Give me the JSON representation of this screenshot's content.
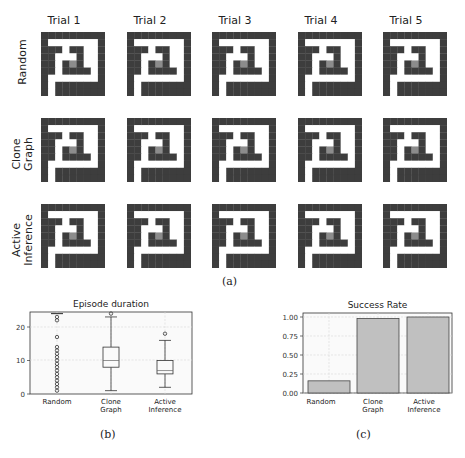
{
  "figure": {
    "panel_a": {
      "caption": "(a)",
      "column_titles": [
        "Trial 1",
        "Trial 2",
        "Trial 3",
        "Trial 4",
        "Trial 5"
      ],
      "row_labels": [
        "Random",
        "Clone\nGraph",
        "Active\nInference"
      ],
      "maze": {
        "size": 9,
        "wall_color": "#3d3d3d",
        "open_color": "#ffffff",
        "goal_color": "#8c8c8c",
        "cells": [
          [
            1,
            1,
            1,
            1,
            1,
            1,
            1,
            1,
            1
          ],
          [
            1,
            0,
            0,
            0,
            0,
            0,
            0,
            0,
            1
          ],
          [
            1,
            1,
            1,
            0,
            1,
            1,
            0,
            0,
            1
          ],
          [
            1,
            1,
            0,
            0,
            0,
            1,
            0,
            0,
            1
          ],
          [
            1,
            1,
            0,
            1,
            2,
            1,
            0,
            0,
            1
          ],
          [
            1,
            1,
            0,
            1,
            1,
            1,
            1,
            0,
            1
          ],
          [
            1,
            0,
            0,
            0,
            0,
            0,
            0,
            0,
            1
          ],
          [
            1,
            0,
            1,
            1,
            1,
            1,
            1,
            1,
            1
          ],
          [
            1,
            0,
            1,
            1,
            1,
            1,
            1,
            1,
            1
          ]
        ]
      }
    },
    "panel_b": {
      "caption": "(b)"
    },
    "panel_c": {
      "caption": "(c)"
    }
  },
  "chart_data": [
    {
      "type": "box",
      "title": "Episode duration",
      "xlabel": "",
      "ylabel": "",
      "categories": [
        "Random",
        "Clone\nGraph",
        "Active\nInference"
      ],
      "yticks": [
        0,
        10,
        20
      ],
      "ylim": [
        0,
        25
      ],
      "grid": true,
      "boxes": [
        {
          "name": "Random",
          "whisker_low": 24,
          "q1": 24,
          "median": 24,
          "q3": 24,
          "whisker_high": 24,
          "outliers": [
            23,
            22,
            17,
            14,
            13,
            12,
            11,
            10,
            9,
            8,
            7,
            6,
            5,
            4,
            3,
            2,
            1
          ]
        },
        {
          "name": "Clone Graph",
          "whisker_low": 1,
          "q1": 8,
          "median": 10,
          "q3": 14,
          "whisker_high": 23,
          "outliers": [
            24
          ]
        },
        {
          "name": "Active Inference",
          "whisker_low": 2,
          "q1": 6,
          "median": 7,
          "q3": 10,
          "whisker_high": 16,
          "outliers": [
            18
          ]
        }
      ]
    },
    {
      "type": "bar",
      "title": "Success Rate",
      "xlabel": "",
      "ylabel": "",
      "categories": [
        "Random",
        "Clone\nGraph",
        "Active\nInference"
      ],
      "values": [
        0.16,
        0.98,
        1.0
      ],
      "yticks": [
        "0.00",
        "0.25",
        "0.50",
        "0.75",
        "1.00"
      ],
      "ylim": [
        0,
        1.05
      ],
      "grid": true,
      "bar_color": "#c0c0c0"
    }
  ]
}
